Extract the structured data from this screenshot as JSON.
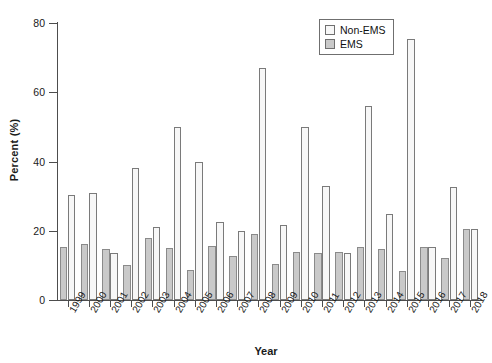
{
  "chart_data": {
    "type": "bar",
    "title": "",
    "xlabel": "Year",
    "ylabel": "Percent (%)",
    "ylim": [
      0,
      80
    ],
    "yticks": [
      0,
      20,
      40,
      60,
      80
    ],
    "grid": false,
    "legend_position": "top-right",
    "categories": [
      "1999",
      "2000",
      "2001",
      "2002",
      "2003",
      "2004",
      "2005",
      "2006",
      "2007",
      "2008",
      "2009",
      "2010",
      "2011",
      "2012",
      "2013",
      "2014",
      "2015",
      "2016",
      "2017",
      "2018"
    ],
    "series": [
      {
        "name": "EMS",
        "color": "#c9c9c9",
        "values": [
          15.2,
          16.3,
          14.8,
          10.0,
          18.0,
          15.0,
          8.7,
          15.7,
          12.8,
          19.0,
          10.5,
          13.8,
          13.6,
          13.8,
          15.3,
          14.6,
          8.4,
          15.3,
          12.0,
          20.4
        ]
      },
      {
        "name": "Non-EMS",
        "color": "#f7f7f7",
        "values": [
          30.2,
          31.0,
          13.6,
          38.0,
          21.0,
          50.0,
          40.0,
          22.4,
          19.8,
          67.0,
          21.6,
          50.0,
          33.0,
          13.6,
          56.0,
          24.7,
          75.3,
          15.3,
          32.5,
          20.4
        ]
      }
    ]
  },
  "legend": {
    "items": [
      {
        "label": "Non-EMS",
        "key": "nonems"
      },
      {
        "label": "EMS",
        "key": "ems"
      }
    ]
  },
  "axes": {
    "y_label": "Percent (%)",
    "x_label": "Year",
    "y_tick_labels": [
      "0",
      "20",
      "40",
      "60",
      "80"
    ]
  }
}
